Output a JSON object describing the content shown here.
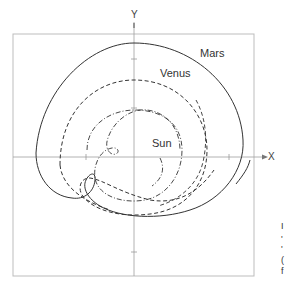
{
  "figure": {
    "axes": {
      "x_label": "X",
      "y_label": "Y"
    },
    "labels": {
      "mars": "Mars",
      "venus": "Venus",
      "sun": "Sun"
    },
    "legend_styles": {
      "mars": "solid",
      "venus": "dashed",
      "sun": "dash-dot"
    },
    "colors": {
      "line": "#333333",
      "frame": "#b8b8b8",
      "axis": "#9a9a9a"
    },
    "caption_fragments": [
      "I",
      "'",
      "'",
      "(",
      "f"
    ]
  }
}
